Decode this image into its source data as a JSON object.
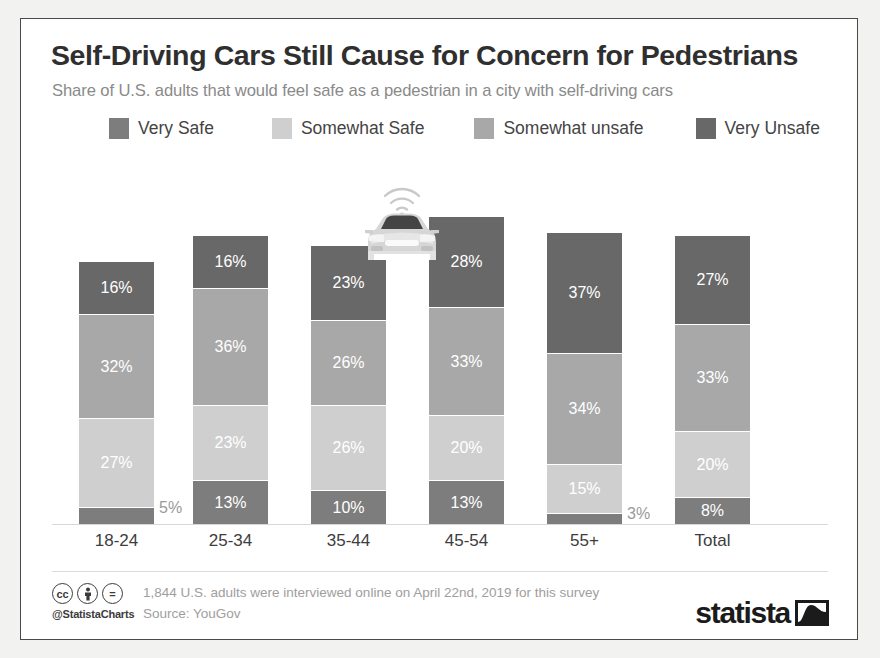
{
  "header": {
    "title": "Self-Driving Cars Still Cause for Concern for Pedestrians",
    "subtitle": "Share of U.S. adults that would feel safe as a pedestrian in a city with self-driving cars"
  },
  "legend": {
    "items": [
      {
        "label": "Very Safe",
        "color": "#7d7d7d"
      },
      {
        "label": "Somewhat Safe",
        "color": "#cfcfcf"
      },
      {
        "label": "Somewhat unsafe",
        "color": "#a8a8a8"
      },
      {
        "label": "Very Unsafe",
        "color": "#686868"
      }
    ]
  },
  "footer": {
    "cc_marks": [
      "cc",
      "person",
      "equals"
    ],
    "handle": "@StatistaCharts",
    "note_line1": "1,844 U.S. adults were interviewed online on April 22nd, 2019 for this survey",
    "note_line2": "Source: YouGov",
    "brand": "statista"
  },
  "icons": {
    "car": "self-driving-car-icon",
    "signal": "wifi-signal-icon"
  },
  "chart_data": {
    "type": "bar",
    "subtype": "stacked-vertical",
    "title": "Self-Driving Cars Still Cause for Concern for Pedestrians",
    "subtitle": "Share of U.S. adults that would feel safe as a pedestrian in a city with self-driving cars",
    "xlabel": "",
    "ylabel": "",
    "unit": "%",
    "grid": false,
    "legend_position": "top",
    "categories": [
      "18-24",
      "25-34",
      "35-44",
      "45-54",
      "55+",
      "Total"
    ],
    "series": [
      {
        "name": "Very Safe",
        "color": "#7d7d7d",
        "values": [
          5,
          13,
          10,
          13,
          3,
          8
        ],
        "labels": [
          "5%",
          "13%",
          "10%",
          "13%",
          "3%",
          "8%"
        ]
      },
      {
        "name": "Somewhat Safe",
        "color": "#cfcfcf",
        "values": [
          27,
          23,
          26,
          20,
          15,
          20
        ],
        "labels": [
          "27%",
          "23%",
          "26%",
          "20%",
          "15%",
          "20%"
        ]
      },
      {
        "name": "Somewhat unsafe",
        "color": "#a8a8a8",
        "values": [
          32,
          36,
          26,
          33,
          34,
          33
        ],
        "labels": [
          "32%",
          "36%",
          "26%",
          "33%",
          "34%",
          "33%"
        ]
      },
      {
        "name": "Very Unsafe",
        "color": "#686868",
        "values": [
          16,
          16,
          23,
          28,
          37,
          27
        ],
        "labels": [
          "16%",
          "16%",
          "23%",
          "28%",
          "37%",
          "27%"
        ]
      }
    ],
    "totals": [
      80,
      88,
      85,
      94,
      89,
      88
    ],
    "outside_labels": [
      {
        "category": "18-24",
        "series": "Very Safe",
        "label": "5%"
      },
      {
        "category": "55+",
        "series": "Very Safe",
        "label": "3%"
      }
    ]
  }
}
